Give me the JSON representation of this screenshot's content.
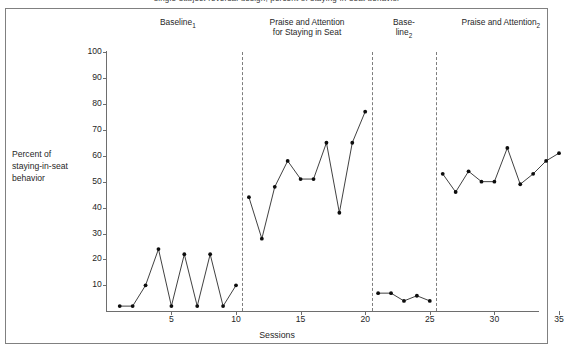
{
  "figure": {
    "cut_caption": "single-subject reversal design, percent of staying-in-seat behavior",
    "x_label": "Sessions",
    "y_label": "Percent of\nstaying-in-seat\nbehavior",
    "y_ticks": [
      "10",
      "20",
      "30",
      "40",
      "50",
      "60",
      "70",
      "80",
      "90",
      "100"
    ],
    "x_ticks": [
      "5",
      "10",
      "15",
      "20",
      "25",
      "30",
      "35"
    ],
    "phases": [
      {
        "name": "phase-baseline-1",
        "label": "Baseline",
        "sub": "1",
        "center_session": 5.5
      },
      {
        "name": "phase-praise-1",
        "label": "Praise and Attention\nfor Staying in Seat",
        "sub": "",
        "center_session": 15.5
      },
      {
        "name": "phase-baseline-2",
        "label": "Base-\nline",
        "sub": "2",
        "center_session": 23.0
      },
      {
        "name": "phase-praise-2",
        "label": "Praise and Attention",
        "sub": "2",
        "center_session": 30.5
      }
    ],
    "phase_dividers": [
      10.5,
      20.5,
      25.5
    ]
  },
  "chart_data": {
    "type": "line",
    "title": "",
    "xlabel": "Sessions",
    "ylabel": "Percent of staying-in-seat behavior",
    "xlim": [
      0.3,
      35.8
    ],
    "ylim": [
      0,
      100
    ],
    "grid": false,
    "legend": "none",
    "annotations": [
      "Baseline1",
      "Praise and Attention for Staying in Seat",
      "Baseline2",
      "Praise and Attention2"
    ],
    "phase_dividers": [
      10.5,
      20.5,
      25.5
    ],
    "series": [
      {
        "name": "Baseline 1",
        "x": [
          1,
          2,
          3,
          4,
          5,
          6,
          7,
          8,
          9,
          10
        ],
        "values": [
          2,
          2,
          10,
          24,
          2,
          22,
          2,
          22,
          2,
          10
        ]
      },
      {
        "name": "Praise and Attention for Staying in Seat",
        "x": [
          11,
          12,
          13,
          14,
          15,
          16,
          17,
          18,
          19,
          20
        ],
        "values": [
          44,
          28,
          48,
          58,
          51,
          51,
          65,
          38,
          65,
          77
        ]
      },
      {
        "name": "Baseline 2",
        "x": [
          21,
          22,
          23,
          24,
          25
        ],
        "values": [
          7,
          7,
          4,
          6,
          4
        ]
      },
      {
        "name": "Praise and Attention 2",
        "x": [
          26,
          27,
          28,
          29,
          30,
          31,
          32,
          33,
          34,
          35
        ],
        "values": [
          53,
          46,
          54,
          50,
          50,
          63,
          49,
          53,
          58,
          61
        ]
      }
    ]
  }
}
